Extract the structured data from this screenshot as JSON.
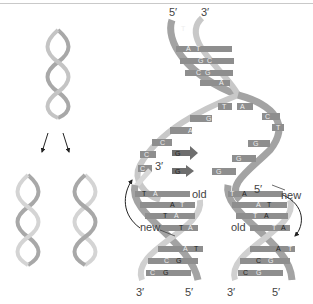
{
  "diagram": {
    "type": "dna-semiconservative-replication",
    "colors": {
      "strand_old": "#a3a3a3",
      "strand_new": "#c8c8c8",
      "base_fill": "#8e8e8e",
      "base_text": "#e8e8e8",
      "free_nucleotide": "#6e6e6e",
      "label_text": "#444444",
      "arrow": "#222222"
    },
    "overview": {
      "parent_helix": "parent double helix",
      "daughter_helices": [
        "daughter helix 1",
        "daughter helix 2"
      ]
    },
    "fork": {
      "top_ends": {
        "left": "5′",
        "right": "3′"
      },
      "top_pairs": [
        {
          "left": "T",
          "right": ""
        },
        {
          "left": "A",
          "right": "T"
        },
        {
          "left": "G",
          "right": "C"
        },
        {
          "left": "C",
          "right": "G"
        },
        {
          "left": "A",
          "right": ""
        }
      ],
      "unpaired_left": [
        "T",
        "G",
        "A",
        "C",
        "C",
        "C"
      ],
      "unpaired_right": [
        "A",
        "C",
        "T",
        "G",
        "G",
        "G"
      ],
      "free_nucleotides": [
        "G",
        "G"
      ],
      "primer_end": "3′",
      "left_daughter": {
        "pairs": [
          {
            "left": "T",
            "right": "A"
          },
          {
            "left": "A",
            "right": "T"
          },
          {
            "left": "T",
            "right": "A"
          },
          {
            "left": "T",
            "right": "A"
          },
          {
            "left": "A",
            "right": "T"
          },
          {
            "left": "C",
            "right": "G"
          },
          {
            "left": "C",
            "right": "G"
          }
        ],
        "label_old": "old",
        "label_new": "new",
        "bottom_ends": {
          "left": "3′",
          "right": "5′"
        }
      },
      "right_daughter": {
        "top_end": "5′",
        "pairs": [
          {
            "left": "T",
            "right": "A"
          },
          {
            "left": "A",
            "right": "T"
          },
          {
            "left": "T",
            "right": "A"
          },
          {
            "left": "T",
            "right": "A"
          },
          {
            "left": "A",
            "right": "T"
          },
          {
            "left": "C",
            "right": "G"
          },
          {
            "left": "C",
            "right": "G"
          }
        ],
        "label_old": "old",
        "label_new": "new",
        "bottom_ends": {
          "left": "3′",
          "right": "5′"
        }
      }
    }
  }
}
